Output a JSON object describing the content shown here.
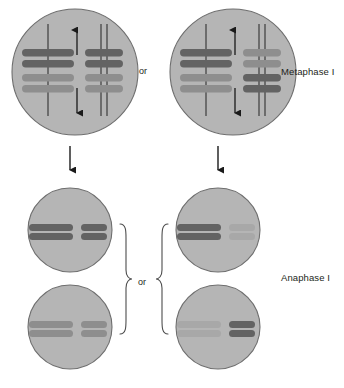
{
  "diagram": {
    "canvas": {
      "width": 344,
      "height": 388,
      "background": "#ffffff"
    },
    "palette": {
      "cell_fill": "#b5b5b5",
      "cell_stroke": "#6e6e6e",
      "chromosome_dark": "#636363",
      "chromosome_medium": "#8e8e8e",
      "chromosome_light": "#a8a8a8",
      "spindle_line": "#3c3c3c",
      "arrow": "#1a1a1a",
      "bracket": "#4d4d4d",
      "text": "#231f20"
    },
    "labels": {
      "metaphase": "Metaphase I",
      "anaphase": "Anaphase I",
      "or_top": "or",
      "or_bottom": "or"
    },
    "rows": [
      {
        "name": "metaphase-row",
        "stage_label": "Metaphase I",
        "separator": "or",
        "cells": [
          {
            "name": "metaphase-cell-left",
            "cx": 75,
            "cy": 72,
            "r": 63,
            "spindle_arrows": {
              "up": true,
              "down": true
            },
            "chromosome_groups": [
              {
                "name": "homolog-pair-long",
                "side": "left",
                "cx": 48,
                "bars": [
                  {
                    "y": 53,
                    "width": 52,
                    "shade": "chromosome_dark"
                  },
                  {
                    "y": 64,
                    "width": 52,
                    "shade": "chromosome_dark"
                  },
                  {
                    "y": 78,
                    "width": 52,
                    "shade": "chromosome_medium"
                  },
                  {
                    "y": 89,
                    "width": 52,
                    "shade": "chromosome_medium"
                  }
                ],
                "spindle_top": true,
                "spindle_bottom": true
              },
              {
                "name": "homolog-pair-short",
                "side": "right",
                "cx": 104,
                "bars": [
                  {
                    "y": 53,
                    "width": 38,
                    "shade": "chromosome_dark"
                  },
                  {
                    "y": 64,
                    "width": 38,
                    "shade": "chromosome_dark"
                  },
                  {
                    "y": 78,
                    "width": 38,
                    "shade": "chromosome_medium"
                  },
                  {
                    "y": 89,
                    "width": 38,
                    "shade": "chromosome_medium"
                  }
                ],
                "spindle_top": true,
                "spindle_bottom": true
              }
            ]
          },
          {
            "name": "metaphase-cell-right",
            "cx": 233,
            "cy": 72,
            "r": 63,
            "spindle_arrows": {
              "up": true,
              "down": true
            },
            "chromosome_groups": [
              {
                "name": "homolog-pair-long",
                "side": "left",
                "cx": 206,
                "bars": [
                  {
                    "y": 53,
                    "width": 52,
                    "shade": "chromosome_dark"
                  },
                  {
                    "y": 64,
                    "width": 52,
                    "shade": "chromosome_dark"
                  },
                  {
                    "y": 78,
                    "width": 52,
                    "shade": "chromosome_medium"
                  },
                  {
                    "y": 89,
                    "width": 52,
                    "shade": "chromosome_medium"
                  }
                ],
                "spindle_top": true,
                "spindle_bottom": true
              },
              {
                "name": "homolog-pair-short",
                "side": "right",
                "cx": 262,
                "bars": [
                  {
                    "y": 53,
                    "width": 38,
                    "shade": "chromosome_medium"
                  },
                  {
                    "y": 64,
                    "width": 38,
                    "shade": "chromosome_medium"
                  },
                  {
                    "y": 78,
                    "width": 38,
                    "shade": "chromosome_dark"
                  },
                  {
                    "y": 89,
                    "width": 38,
                    "shade": "chromosome_dark"
                  }
                ],
                "spindle_top": true,
                "spindle_bottom": true
              }
            ]
          }
        ]
      },
      {
        "name": "anaphase-row",
        "stage_label": "Anaphase I",
        "separator": "or",
        "cells": [
          {
            "name": "anaphase-cell-top-left",
            "cx": 70,
            "cy": 230,
            "r": 42,
            "chromosome_groups": [
              {
                "name": "chromatid-pair-long",
                "side": "left",
                "cx": 51,
                "bars": [
                  {
                    "y": 227,
                    "width": 44,
                    "shade": "chromosome_dark"
                  },
                  {
                    "y": 236,
                    "width": 44,
                    "shade": "chromosome_dark"
                  }
                ]
              },
              {
                "name": "chromatid-pair-short",
                "side": "right",
                "cx": 94,
                "bars": [
                  {
                    "y": 227,
                    "width": 26,
                    "shade": "chromosome_dark"
                  },
                  {
                    "y": 236,
                    "width": 26,
                    "shade": "chromosome_dark"
                  }
                ]
              }
            ]
          },
          {
            "name": "anaphase-cell-bottom-left",
            "cx": 70,
            "cy": 327,
            "r": 42,
            "chromosome_groups": [
              {
                "name": "chromatid-pair-long",
                "side": "left",
                "cx": 51,
                "bars": [
                  {
                    "y": 324,
                    "width": 44,
                    "shade": "chromosome_medium"
                  },
                  {
                    "y": 333,
                    "width": 44,
                    "shade": "chromosome_medium"
                  }
                ]
              },
              {
                "name": "chromatid-pair-short",
                "side": "right",
                "cx": 94,
                "bars": [
                  {
                    "y": 324,
                    "width": 26,
                    "shade": "chromosome_medium"
                  },
                  {
                    "y": 333,
                    "width": 26,
                    "shade": "chromosome_medium"
                  }
                ]
              }
            ]
          },
          {
            "name": "anaphase-cell-top-right",
            "cx": 218,
            "cy": 230,
            "r": 42,
            "chromosome_groups": [
              {
                "name": "chromatid-pair-long",
                "side": "left",
                "cx": 199,
                "bars": [
                  {
                    "y": 227,
                    "width": 44,
                    "shade": "chromosome_dark"
                  },
                  {
                    "y": 236,
                    "width": 44,
                    "shade": "chromosome_dark"
                  }
                ]
              },
              {
                "name": "chromatid-pair-short",
                "side": "right",
                "cx": 242,
                "bars": [
                  {
                    "y": 227,
                    "width": 26,
                    "shade": "chromosome_medium"
                  },
                  {
                    "y": 236,
                    "width": 26,
                    "shade": "chromosome_medium"
                  }
                ]
              }
            ]
          },
          {
            "name": "anaphase-cell-bottom-right",
            "cx": 218,
            "cy": 327,
            "r": 42,
            "chromosome_groups": [
              {
                "name": "chromatid-pair-long",
                "side": "left",
                "cx": 199,
                "bars": [
                  {
                    "y": 324,
                    "width": 44,
                    "shade": "chromosome_medium"
                  },
                  {
                    "y": 333,
                    "width": 44,
                    "shade": "chromosome_medium"
                  }
                ]
              },
              {
                "name": "chromatid-pair-short",
                "side": "right",
                "cx": 242,
                "bars": [
                  {
                    "y": 324,
                    "width": 26,
                    "shade": "chromosome_dark"
                  },
                  {
                    "y": 333,
                    "width": 26,
                    "shade": "chromosome_dark"
                  }
                ]
              }
            ]
          }
        ]
      }
    ],
    "transition_arrows": [
      {
        "name": "transition-arrow-left",
        "x": 70,
        "y_start": 146,
        "y_end": 172
      },
      {
        "name": "transition-arrow-right",
        "x": 218,
        "y_start": 146,
        "y_end": 172
      }
    ],
    "brackets": [
      {
        "name": "bracket-left-group",
        "x": 126,
        "y_top": 222,
        "y_bottom": 336,
        "direction": "right"
      },
      {
        "name": "bracket-right-group",
        "x": 162,
        "y_top": 222,
        "y_bottom": 336,
        "direction": "left"
      }
    ]
  }
}
